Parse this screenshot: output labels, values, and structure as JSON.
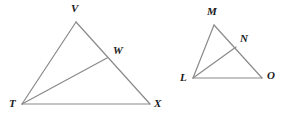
{
  "diagram": {
    "type": "geometry-figure",
    "background_color": "#ffffff",
    "stroke_color": "#8a8a8a",
    "label_color": "#1a1a1a",
    "stroke_width": 1.2,
    "canvas": {
      "width": 290,
      "height": 123
    },
    "figures": [
      {
        "name": "triangle-TVX",
        "vertices": [
          {
            "id": "T",
            "label": "T",
            "x": 22,
            "y": 104,
            "label_x": 9,
            "label_y": 98
          },
          {
            "id": "V",
            "label": "V",
            "x": 76,
            "y": 22,
            "label_x": 71,
            "label_y": 3
          },
          {
            "id": "X",
            "label": "X",
            "x": 150,
            "y": 104,
            "label_x": 154,
            "label_y": 98
          }
        ],
        "interior_points": [
          {
            "id": "W",
            "label": "W",
            "x": 107,
            "y": 58,
            "label_x": 113,
            "label_y": 45,
            "on_segment": "VX"
          }
        ],
        "segments": [
          {
            "from": "T",
            "to": "V"
          },
          {
            "from": "V",
            "to": "X"
          },
          {
            "from": "T",
            "to": "X"
          },
          {
            "from": "T",
            "to": "W"
          }
        ]
      },
      {
        "name": "triangle-LMO",
        "vertices": [
          {
            "id": "L",
            "label": "L",
            "x": 193,
            "y": 78,
            "label_x": 180,
            "label_y": 72
          },
          {
            "id": "M",
            "label": "M",
            "x": 214,
            "y": 25,
            "label_x": 207,
            "label_y": 6
          },
          {
            "id": "O",
            "label": "O",
            "x": 262,
            "y": 78,
            "label_x": 267,
            "label_y": 70
          }
        ],
        "interior_points": [
          {
            "id": "N",
            "label": "N",
            "x": 236,
            "y": 47,
            "label_x": 240,
            "label_y": 33,
            "on_segment": "MO"
          }
        ],
        "segments": [
          {
            "from": "L",
            "to": "M"
          },
          {
            "from": "M",
            "to": "O"
          },
          {
            "from": "L",
            "to": "O"
          },
          {
            "from": "L",
            "to": "N"
          }
        ]
      }
    ]
  }
}
